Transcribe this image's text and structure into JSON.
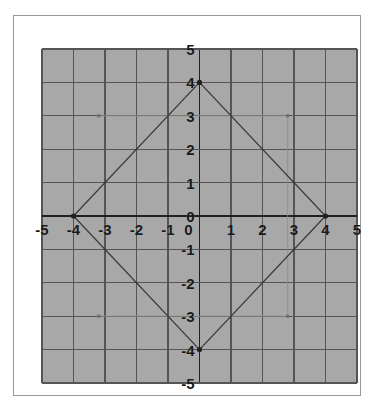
{
  "figure": {
    "background_color": "#ffffff",
    "frame_color": "#9a9a9a",
    "plot_background_color": "#a8a8a8"
  },
  "chart_data": {
    "type": "scatter",
    "title": "",
    "xlabel": "",
    "ylabel": "",
    "xlim": [
      -5,
      5
    ],
    "ylim": [
      -5,
      5
    ],
    "grid": true,
    "grid_step": 1,
    "grid_color": "#555555",
    "axis_color": "#202020",
    "legend": "none",
    "x_tick_labels": [
      "-5",
      "-4",
      "-3",
      "-2",
      "-1",
      "0",
      "1",
      "2",
      "3",
      "4",
      "5"
    ],
    "x_tick_values": [
      -5,
      -4,
      -3,
      -2,
      -1,
      0,
      1,
      2,
      3,
      4,
      5
    ],
    "y_tick_labels": [
      "5",
      "4",
      "3",
      "2",
      "1",
      "0",
      "-1",
      "-2",
      "-3",
      "-4",
      "-5"
    ],
    "y_tick_values": [
      5,
      4,
      3,
      2,
      1,
      0,
      -1,
      -2,
      -3,
      -4,
      -5
    ],
    "series": [
      {
        "name": "rhombus",
        "type": "polygon",
        "closed": true,
        "stroke": "#3a3a3a",
        "stroke_width": 1.3,
        "points": [
          {
            "x": 0,
            "y": 4,
            "label": "(0, 4)"
          },
          {
            "x": 4,
            "y": 0,
            "label": "(4, 0)"
          },
          {
            "x": 0,
            "y": -4,
            "label": "(0, -4)"
          },
          {
            "x": -4,
            "y": 0,
            "label": "(-4, 0)"
          }
        ]
      },
      {
        "name": "vertex-markers",
        "type": "scatter",
        "marker": "dot",
        "color": "#202020",
        "size": 2.6,
        "points": [
          {
            "x": 0,
            "y": 4
          },
          {
            "x": 4,
            "y": 0
          },
          {
            "x": 0,
            "y": -4
          },
          {
            "x": -4,
            "y": 0
          }
        ]
      },
      {
        "name": "construction-guides",
        "type": "line",
        "stroke": "#8e8e8e",
        "stroke_width": 0.9,
        "note": "faint auxiliary rectangle guide lines",
        "segments": [
          {
            "x1": -3.2,
            "y1": 3,
            "x2": 2.8,
            "y2": 3
          },
          {
            "x1": -3.2,
            "y1": -3,
            "x2": 2.8,
            "y2": -3
          },
          {
            "x1": 2.8,
            "y1": 3,
            "x2": 2.8,
            "y2": -3
          }
        ],
        "endpoint_markers": [
          {
            "x": -3.2,
            "y": 3
          },
          {
            "x": 2.8,
            "y": 3
          },
          {
            "x": -3.2,
            "y": -3
          },
          {
            "x": 2.8,
            "y": -3
          }
        ]
      }
    ]
  }
}
